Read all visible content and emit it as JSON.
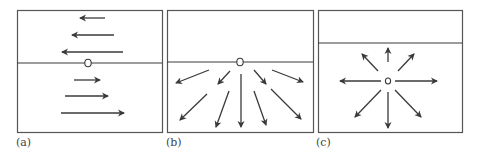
{
  "figure": {
    "panels": [
      {
        "id": "a",
        "label": "(a)",
        "frame": {
          "x": 17,
          "y": 10,
          "w": 145,
          "h": 122
        },
        "interface_y": 63,
        "source": {
          "x": 88,
          "y": 63
        },
        "description": "Horizontal interface; arrows above point left, arrows below point right, lengths increasing away from the interface",
        "arrows": [
          {
            "x1": 105,
            "y1": 18,
            "x2": 80,
            "y2": 18
          },
          {
            "x1": 114,
            "y1": 35,
            "x2": 72,
            "y2": 35
          },
          {
            "x1": 123,
            "y1": 52,
            "x2": 62,
            "y2": 52
          },
          {
            "x1": 74,
            "y1": 80,
            "x2": 100,
            "y2": 80
          },
          {
            "x1": 65,
            "y1": 96,
            "x2": 108,
            "y2": 96
          },
          {
            "x1": 61,
            "y1": 113,
            "x2": 124,
            "y2": 113
          }
        ]
      },
      {
        "id": "b",
        "label": "(b)",
        "frame": {
          "x": 167,
          "y": 10,
          "w": 146,
          "h": 122
        },
        "interface_y": 62,
        "source": {
          "x": 240,
          "y": 62
        },
        "description": "Source on interface; arrows radiate downward into lower medium only",
        "arrows": [
          {
            "x1": 209,
            "y1": 70,
            "x2": 176,
            "y2": 83
          },
          {
            "x1": 230,
            "y1": 71,
            "x2": 218,
            "y2": 84
          },
          {
            "x1": 207,
            "y1": 94,
            "x2": 180,
            "y2": 120
          },
          {
            "x1": 229,
            "y1": 91,
            "x2": 216,
            "y2": 127
          },
          {
            "x1": 241,
            "y1": 74,
            "x2": 241,
            "y2": 127
          },
          {
            "x1": 254,
            "y1": 70,
            "x2": 266,
            "y2": 84
          },
          {
            "x1": 254,
            "y1": 91,
            "x2": 266,
            "y2": 125
          },
          {
            "x1": 272,
            "y1": 70,
            "x2": 303,
            "y2": 82
          },
          {
            "x1": 271,
            "y1": 89,
            "x2": 301,
            "y2": 119
          }
        ]
      },
      {
        "id": "c",
        "label": "(c)",
        "frame": {
          "x": 318,
          "y": 10,
          "w": 144,
          "h": 122
        },
        "interface_y": 43,
        "source": {
          "x": 388,
          "y": 81
        },
        "description": "Source below interface; arrows radiate in all directions",
        "arrows": [
          {
            "x1": 388,
            "y1": 62,
            "x2": 388,
            "y2": 48
          },
          {
            "x1": 378,
            "y1": 71,
            "x2": 362,
            "y2": 54
          },
          {
            "x1": 398,
            "y1": 71,
            "x2": 414,
            "y2": 54
          },
          {
            "x1": 381,
            "y1": 81,
            "x2": 340,
            "y2": 81
          },
          {
            "x1": 395,
            "y1": 81,
            "x2": 437,
            "y2": 81
          },
          {
            "x1": 381,
            "y1": 90,
            "x2": 355,
            "y2": 117
          },
          {
            "x1": 388,
            "y1": 92,
            "x2": 388,
            "y2": 128
          },
          {
            "x1": 395,
            "y1": 90,
            "x2": 421,
            "y2": 117
          }
        ]
      }
    ],
    "colors": {
      "stroke": "#3a3a3a",
      "frame": "#555555",
      "background": "#ffffff"
    }
  }
}
